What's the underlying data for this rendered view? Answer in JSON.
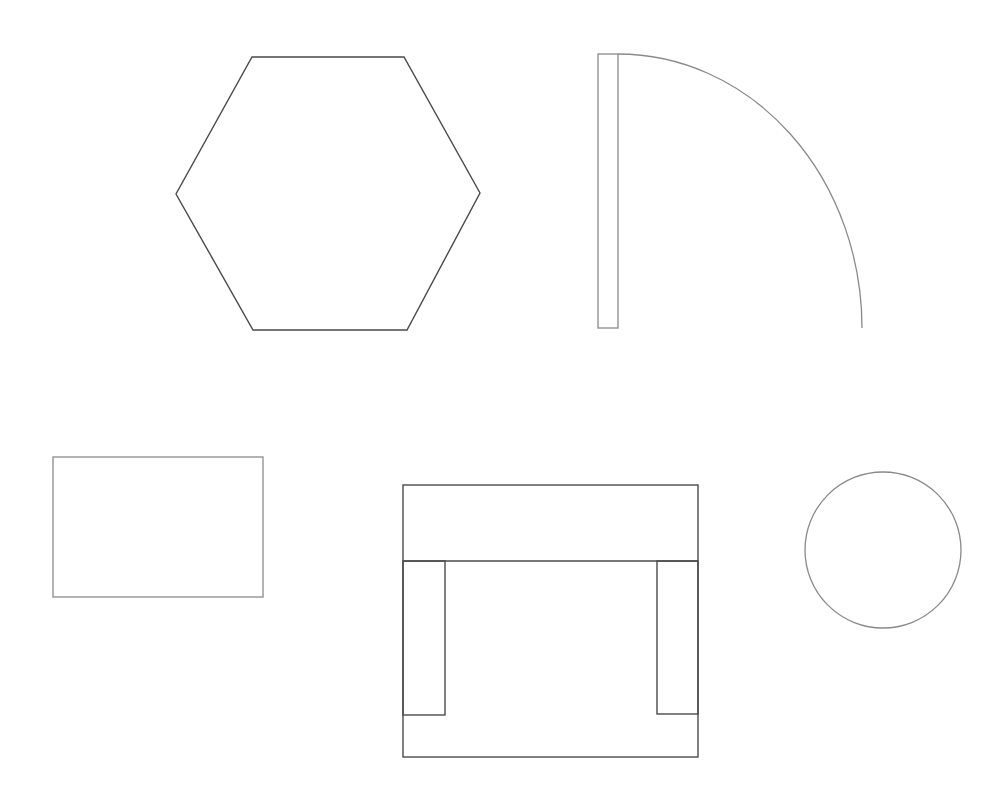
{
  "canvas": {
    "width": 1007,
    "height": 795,
    "background": "#ffffff"
  },
  "colors": {
    "line_dark": "#4a4a4a",
    "line_light": "#8a8a8a"
  },
  "shapes": {
    "hexagon": {
      "label": "hexagon",
      "points": "252,57 404,57 480,193 407,330 253,330 176,194"
    },
    "door": {
      "label": "door-swing",
      "panel": {
        "x": 598,
        "y": 54,
        "width": 20,
        "height": 274
      },
      "arc": "M 618 54 A 244 274 0 0 1 862 328"
    },
    "rectangle": {
      "label": "rectangle",
      "x": 53,
      "y": 457,
      "width": 210,
      "height": 140
    },
    "armchair": {
      "label": "armchair",
      "outer": {
        "x": 403,
        "y": 485,
        "width": 295,
        "height": 272
      },
      "back_line_y": 561,
      "left_arm": {
        "x": 403,
        "y": 561,
        "width": 42,
        "height": 154
      },
      "right_arm": {
        "x": 657,
        "y": 561,
        "width": 41,
        "height": 153
      }
    },
    "circle": {
      "label": "circle",
      "cx": 883,
      "cy": 550,
      "r": 78
    }
  }
}
